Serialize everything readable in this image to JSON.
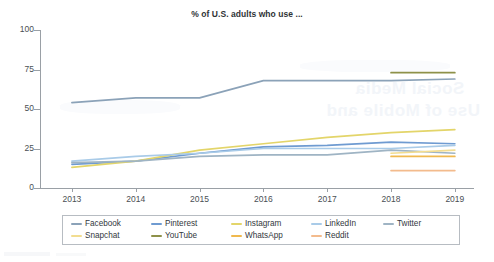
{
  "chart_data": {
    "type": "line",
    "title": "% of U.S. adults who use ...",
    "xlabel": "",
    "ylabel": "",
    "xlim": [
      2012.5,
      2019.3
    ],
    "ylim": [
      0,
      100
    ],
    "grid": false,
    "legend_position": "bottom",
    "x": [
      2013,
      2014,
      2015,
      2016,
      2017,
      2018,
      2019
    ],
    "yticks": [
      0,
      25,
      50,
      75,
      100
    ],
    "xticks": [
      2013,
      2014,
      2015,
      2016,
      2017,
      2018,
      2019
    ],
    "series": [
      {
        "name": "Facebook",
        "color": "#8ba2b8",
        "values": [
          54,
          57,
          57,
          68,
          68,
          68,
          69
        ]
      },
      {
        "name": "Pinterest",
        "color": "#6f9bd1",
        "values": [
          15,
          17,
          22,
          26,
          27,
          29,
          28
        ]
      },
      {
        "name": "Instagram",
        "color": "#e3d56a",
        "values": [
          13,
          17,
          24,
          28,
          32,
          35,
          37
        ]
      },
      {
        "name": "LinkedIn",
        "color": "#a9cbe8",
        "values": [
          17,
          20,
          22,
          25,
          25,
          25,
          27
        ]
      },
      {
        "name": "Twitter",
        "color": "#9fb4c4",
        "values": [
          16,
          17,
          20,
          21,
          21,
          24,
          22
        ]
      },
      {
        "name": "Snapchat",
        "color": "#f2dd91",
        "values": [
          null,
          null,
          null,
          null,
          null,
          22,
          24
        ]
      },
      {
        "name": "YouTube",
        "color": "#8e9149",
        "values": [
          null,
          null,
          null,
          null,
          null,
          73,
          73
        ]
      },
      {
        "name": "WhatsApp",
        "color": "#f0b94e",
        "values": [
          null,
          null,
          null,
          null,
          null,
          20,
          20
        ]
      },
      {
        "name": "Reddit",
        "color": "#f3bb8d",
        "values": [
          null,
          null,
          null,
          null,
          null,
          11,
          11
        ]
      }
    ]
  },
  "legend": {
    "row1": [
      "Facebook",
      "Pinterest",
      "Instagram",
      "LinkedIn",
      "Twitter"
    ],
    "row2": [
      "Snapchat",
      "YouTube",
      "WhatsApp",
      "Reddit"
    ]
  }
}
